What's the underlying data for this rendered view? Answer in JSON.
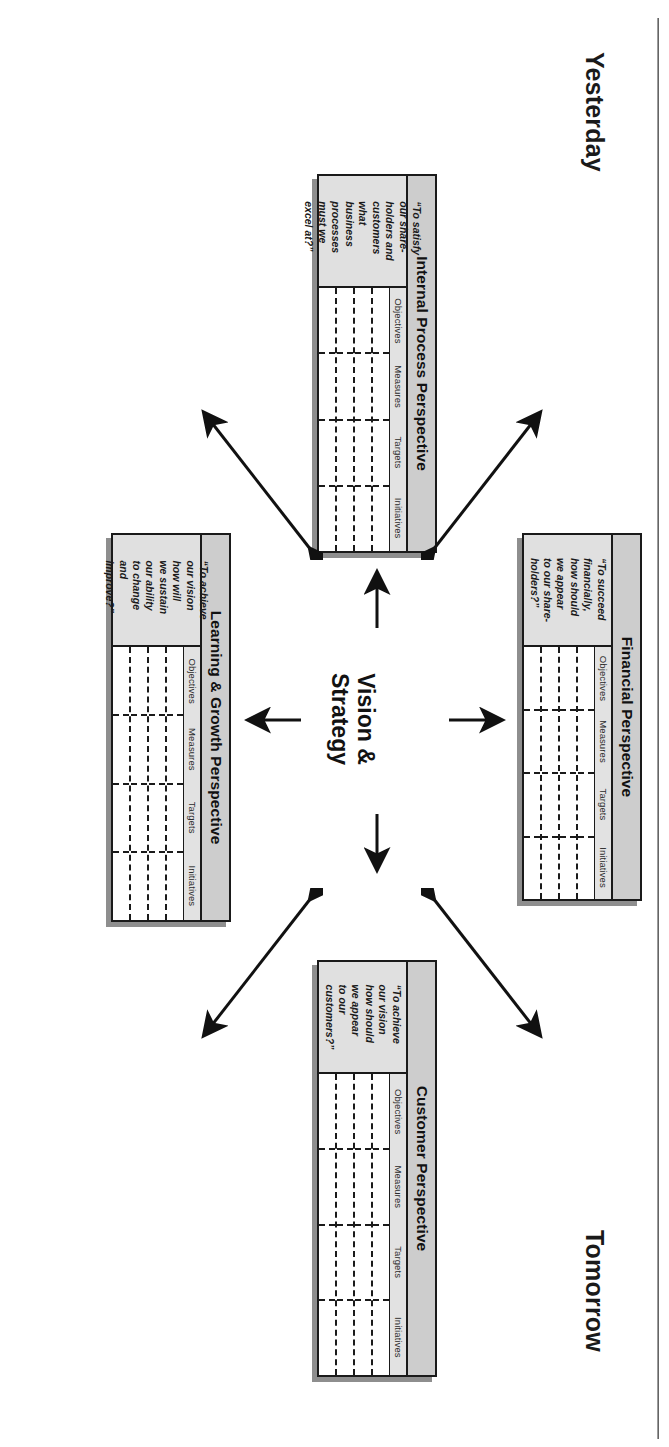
{
  "diagram": {
    "title_text": "Balanced Scorecard Framework",
    "center": {
      "label": "Vision &\nStrategy"
    },
    "timeline": {
      "yesterday": "Yesterday",
      "today": "Today",
      "tomorrow": "Tomorrow"
    },
    "columns": [
      "Objectives",
      "Measures",
      "Targets",
      "Initiatives"
    ],
    "cards": {
      "financial": {
        "title": "Financial Perspective",
        "quote": "“To succeed\nfinancially,\nhow should\nwe appear\nto our share-\nholders?”"
      },
      "customer": {
        "title": "Customer Perspective",
        "quote": "“To achieve\nour vision\nhow should\nwe appear\nto our\ncustomers?”"
      },
      "internal": {
        "title": "Internal Process Perspective",
        "quote": "“To satisfy\nour share-\nholders and\ncustomers\nwhat\nbusiness\nprocesses\nmust we\nexcel at?”"
      },
      "learning": {
        "title": "Learning & Growth Perspective",
        "quote": "“To achieve\nour vision\nhow will\nwe sustain\nour ability\nto change\nand\nimprove?”"
      }
    },
    "colors": {
      "ink": "#1a1a1a",
      "title_band": "#cdcdcd",
      "quote_band": "#e0e0e0",
      "header_band": "#e2e2e2",
      "shadow": "#8e8e8e",
      "page": "#ffffff"
    }
  }
}
